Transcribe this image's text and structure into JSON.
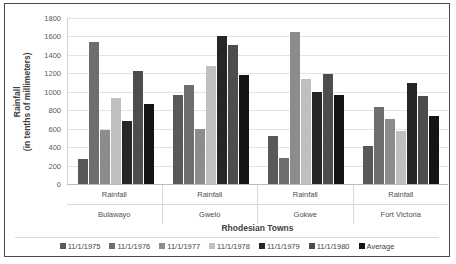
{
  "chart_data": {
    "type": "bar",
    "title": "",
    "xlabel": "Rhodesian Towns",
    "ylabel": "Rainfall (in tenths of millimeters)",
    "ylabel_main": "Rainfall",
    "ylabel_sub": "(in tenths of millimeters)",
    "ylim": [
      0,
      1800
    ],
    "ytick_step": 200,
    "yticks": [
      "1800",
      "1600",
      "1400",
      "1200",
      "1000",
      "800",
      "600",
      "400",
      "200",
      "0"
    ],
    "ytick_values": [
      1800,
      1600,
      1400,
      1200,
      1000,
      800,
      600,
      400,
      200,
      0
    ],
    "grid": true,
    "legend_position": "bottom",
    "categories": [
      "Bulawayo",
      "Gwelo",
      "Gokwe",
      "Fort Victoria"
    ],
    "category_sublabels": [
      "Rainfall",
      "Rainfall",
      "Rainfall",
      "Rainfall"
    ],
    "series": [
      {
        "name": "11/1/1975",
        "color": "#595959",
        "values": [
          270,
          960,
          520,
          410
        ]
      },
      {
        "name": "11/1/1976",
        "color": "#6e6e6e",
        "values": [
          1540,
          1070,
          280,
          830
        ]
      },
      {
        "name": "11/1/1977",
        "color": "#8c8c8c",
        "values": [
          590,
          600,
          1650,
          700
        ]
      },
      {
        "name": "11/1/1978",
        "color": "#bfbfbf",
        "values": [
          930,
          1280,
          1140,
          580
        ]
      },
      {
        "name": "11/1/1979",
        "color": "#262626",
        "values": [
          680,
          1600,
          1000,
          1090
        ]
      },
      {
        "name": "11/1/1980",
        "color": "#4d4d4d",
        "values": [
          1230,
          1510,
          1190,
          950
        ]
      },
      {
        "name": "Average",
        "color": "#141414",
        "values": [
          870,
          1180,
          960,
          740
        ]
      }
    ]
  },
  "legend": {
    "items": [
      {
        "label": "11/1/1975",
        "color": "#595959"
      },
      {
        "label": "11/1/1976",
        "color": "#6e6e6e"
      },
      {
        "label": "11/1/1977",
        "color": "#8c8c8c"
      },
      {
        "label": "11/1/1978",
        "color": "#bfbfbf"
      },
      {
        "label": "11/1/1979",
        "color": "#262626"
      },
      {
        "label": "11/1/1980",
        "color": "#4d4d4d"
      },
      {
        "label": "Average",
        "color": "#141414"
      }
    ]
  },
  "colors": {
    "border": "#4a4a4a",
    "gridline": "#e3e3e3",
    "axis": "#bdbdbd",
    "text": "#3f3f3f",
    "tick_text": "#595959",
    "background": "#ffffff"
  }
}
